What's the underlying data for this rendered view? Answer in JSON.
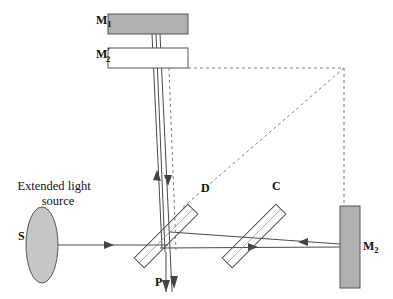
{
  "figure": {
    "kind": "optics-ray-diagram",
    "name": "Michelson interferometer",
    "background_color": "#ffffff",
    "line_color": "#444444",
    "mirror_fill": "#b0b0b0",
    "mirror_stroke": "#555555",
    "plate_fill": "#ffffff",
    "plate_stroke": "#555555",
    "source_fill": "#c6c6c6",
    "source_stroke": "#555555",
    "dashed_color": "#777777"
  },
  "labels": {
    "mirror_1": {
      "base": "M",
      "sub": "1",
      "prime": "",
      "x": 96,
      "y": 24
    },
    "mirror_2_virtual": {
      "base": "M",
      "sub": "2",
      "prime": "'",
      "x": 96,
      "y": 61
    },
    "mirror_2": {
      "base": "M",
      "sub": "2",
      "prime": "",
      "x": 363,
      "y": 250
    },
    "source": {
      "base": "S",
      "sub": "",
      "prime": "",
      "x": 18,
      "y": 240
    },
    "beamsplitter": {
      "base": "D",
      "sub": "",
      "prime": "",
      "x": 201,
      "y": 192
    },
    "compensator": {
      "base": "C",
      "sub": "",
      "prime": "",
      "x": 272,
      "y": 190
    },
    "observation": {
      "base": "P",
      "sub": "",
      "prime": "",
      "x": 162,
      "y": 283
    }
  },
  "source_caption": {
    "line1": "Extended light",
    "line2": "source",
    "x": 54,
    "y1": 190,
    "y2": 204
  },
  "components": {
    "mirror_1": {
      "x": 108,
      "y": 14,
      "width": 80,
      "height": 20,
      "filled": true
    },
    "mirror_2_virtual": {
      "x": 108,
      "y": 48,
      "width": 80,
      "height": 20,
      "filled": false
    },
    "mirror_2": {
      "x": 340,
      "y": 206,
      "width": 20,
      "height": 82,
      "filled": true
    },
    "source_ellipse": {
      "cx": 42,
      "cy": 245,
      "rx": 16,
      "ry": 38
    },
    "beamsplitter_plate": {
      "cx": 166,
      "cy": 236,
      "length": 76,
      "thickness": 14,
      "angle": -45
    },
    "compensator_plate": {
      "cx": 254,
      "cy": 236,
      "length": 76,
      "thickness": 14,
      "angle": -45
    }
  },
  "ray_annotations": {
    "source_to_splitter": "incident beam from extended source S travels right to beamsplitter D",
    "splitter_to_mirror1": "beam reflected upward to mirror M1 and back down",
    "splitter_to_mirror2": "beam transmitted right through compensator C to mirror M2 and back",
    "splitter_to_screen": "recombined beams travel downward to observation plane P",
    "virtual_image_construction": "dashed lines mark virtual image M2' of mirror M2"
  }
}
